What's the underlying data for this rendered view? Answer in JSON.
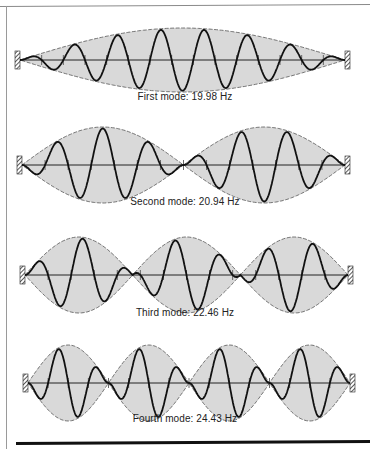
{
  "figure": {
    "colors": {
      "envelope_fill": "#d9d9d9",
      "envelope_stroke": "#555555",
      "wave_stroke": "#111111",
      "axis_stroke": "#222222"
    },
    "modes": [
      {
        "caption": "First mode: 19.98 Hz",
        "frequency_hz": 19.98,
        "loops": 1,
        "wave_cycles": 7.5,
        "y_axis": 60,
        "amplitude": 32,
        "x_start": 20,
        "x_end": 345,
        "caption_y": 97
      },
      {
        "caption": "Second mode: 20.94 Hz",
        "frequency_hz": 20.94,
        "loops": 2,
        "wave_cycles": 7,
        "y_axis": 165,
        "amplitude": 38,
        "x_start": 22,
        "x_end": 345,
        "caption_y": 202
      },
      {
        "caption": "Third mode: 22.46 Hz",
        "frequency_hz": 22.46,
        "loops": 3,
        "wave_cycles": 7,
        "y_axis": 275,
        "amplitude": 38,
        "x_start": 25,
        "x_end": 348,
        "caption_y": 313
      },
      {
        "caption": "Fourth mode: 24.43 Hz",
        "frequency_hz": 24.43,
        "loops": 4,
        "wave_cycles": 8,
        "y_axis": 383,
        "amplitude": 38,
        "x_start": 28,
        "x_end": 350,
        "caption_y": 419
      }
    ]
  }
}
